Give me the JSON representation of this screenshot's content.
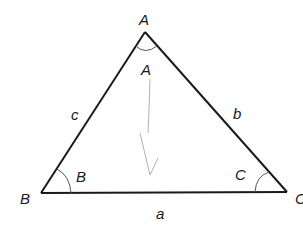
{
  "diagram": {
    "type": "triangle",
    "vertices": {
      "A": {
        "label": "A",
        "x": 145,
        "y": 32
      },
      "B": {
        "label": "B",
        "x": 41,
        "y": 193
      },
      "C": {
        "label": "C",
        "x": 287,
        "y": 192
      }
    },
    "sides": {
      "a": {
        "label": "a",
        "between": "B-C"
      },
      "b": {
        "label": "b",
        "between": "A-C"
      },
      "c": {
        "label": "c",
        "between": "A-B"
      }
    },
    "angles": {
      "A": {
        "label": "A"
      },
      "B": {
        "label": "B"
      },
      "C": {
        "label": "C"
      }
    },
    "annotation": {
      "description": "faint pencil arrow pointing down inside triangle"
    },
    "colors": {
      "line": "#1a1a1a",
      "arc": "#555555",
      "pencil": "#b0b0b0"
    }
  }
}
